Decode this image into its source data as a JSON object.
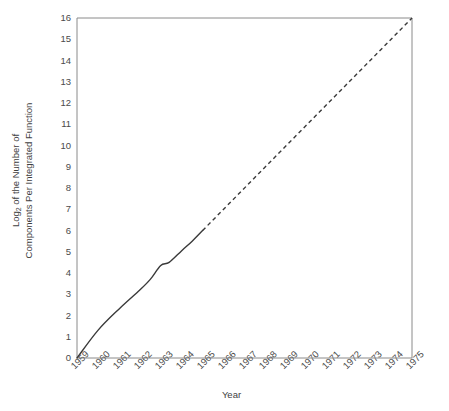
{
  "chart_data": {
    "type": "line",
    "title": "",
    "xlabel": "Year",
    "ylabel_line1": "Log",
    "ylabel_sub": "2",
    "ylabel_line1_rest": " of the Number of",
    "ylabel_line2": "Components Per Integrated Function",
    "xlim": [
      1959,
      1975
    ],
    "ylim": [
      0,
      16
    ],
    "grid": false,
    "legend": null,
    "categories": [
      "1959",
      "1960",
      "1961",
      "1962",
      "1963",
      "1964",
      "1965",
      "1966",
      "1967",
      "1968",
      "1969",
      "1970",
      "1971",
      "1972",
      "1973",
      "1974",
      "1975"
    ],
    "yticks": [
      "0",
      "1",
      "2",
      "3",
      "4",
      "5",
      "6",
      "7",
      "8",
      "9",
      "10",
      "11",
      "12",
      "13",
      "14",
      "15",
      "16"
    ],
    "series": [
      {
        "name": "Observed",
        "style": "solid",
        "color": "#3a3a3a",
        "x": [
          1959,
          1960,
          1961,
          1962,
          1962.5,
          1963,
          1963.4,
          1964,
          1964.5,
          1965
        ],
        "values": [
          0,
          1.3,
          2.3,
          3.2,
          3.7,
          4.35,
          4.5,
          5.05,
          5.5,
          6.0
        ]
      },
      {
        "name": "Extrapolated",
        "style": "dashed",
        "color": "#3a3a3a",
        "x": [
          1965,
          1975
        ],
        "values": [
          6.0,
          16.0
        ]
      }
    ]
  },
  "axes": {
    "frame_color": "#8a8a8a",
    "line_color": "#3a3a3a"
  }
}
